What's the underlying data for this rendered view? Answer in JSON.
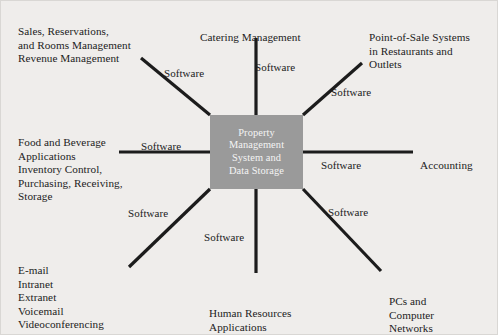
{
  "figure": {
    "background_color": "#efedeb",
    "center_node": {
      "label": "Property\nManagement\nSystem and\nData Storage",
      "fill_color": "#9a9a9a",
      "text_color": "#f4f4f4"
    },
    "nodes": [
      {
        "id": "sales-reservations",
        "label": "Sales, Reservations,\nand Rooms Management\nRevenue Management",
        "position": "top-left"
      },
      {
        "id": "catering-management",
        "label": "Catering Management",
        "position": "top-center"
      },
      {
        "id": "point-of-sale",
        "label": "Point-of-Sale Systems\nin Restaurants and\nOutlets",
        "position": "top-right"
      },
      {
        "id": "food-and-beverage",
        "label": "Food and Beverage\nApplications\nInventory Control,\nPurchasing, Receiving,\nStorage",
        "position": "middle-left"
      },
      {
        "id": "accounting",
        "label": "Accounting",
        "position": "middle-right"
      },
      {
        "id": "communications",
        "label": "E-mail\nIntranet\nExtranet\nVoicemail\nVideoconferencing",
        "position": "bottom-left"
      },
      {
        "id": "human-resources",
        "label": "Human Resources\nApplications",
        "position": "bottom-center"
      },
      {
        "id": "pcs-networks",
        "label": "PCs and\nComputer\nNetworks",
        "position": "bottom-right"
      }
    ],
    "edge_labels": [
      {
        "id": "edge-label-sales",
        "text": "Software"
      },
      {
        "id": "edge-label-catering",
        "text": "Software"
      },
      {
        "id": "edge-label-pos",
        "text": "Software"
      },
      {
        "id": "edge-label-food",
        "text": "Software"
      },
      {
        "id": "edge-label-accounting",
        "text": "Software"
      },
      {
        "id": "edge-label-communications",
        "text": "Software"
      },
      {
        "id": "edge-label-hr",
        "text": "Software"
      },
      {
        "id": "edge-label-pcs",
        "text": "Software"
      }
    ],
    "edge_color": "#1c1c1c"
  }
}
